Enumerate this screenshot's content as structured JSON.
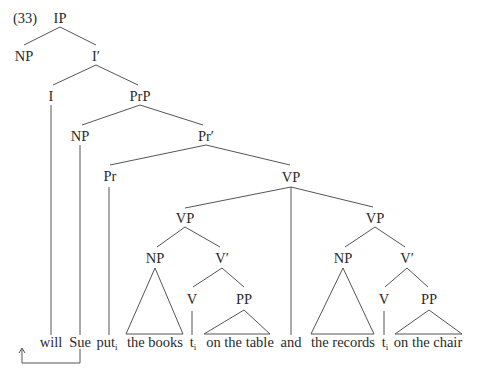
{
  "example_number": "(33)",
  "tree": {
    "nodes": [
      {
        "id": "IP",
        "label": "IP",
        "x": 60,
        "y": 18
      },
      {
        "id": "NP1",
        "label": "NP",
        "x": 29,
        "y": 56
      },
      {
        "id": "Ibar",
        "label": "I′",
        "x": 96,
        "y": 56
      },
      {
        "id": "I",
        "label": "I",
        "x": 51,
        "y": 96
      },
      {
        "id": "PrP",
        "label": "PrP",
        "x": 140,
        "y": 96
      },
      {
        "id": "NP2",
        "label": "NP",
        "x": 80,
        "y": 136
      },
      {
        "id": "Prbar",
        "label": "Pr′",
        "x": 206,
        "y": 136
      },
      {
        "id": "Pr",
        "label": "Pr",
        "x": 110,
        "y": 176
      },
      {
        "id": "VP0",
        "label": "VP",
        "x": 291,
        "y": 176
      },
      {
        "id": "VP1",
        "label": "VP",
        "x": 185,
        "y": 218
      },
      {
        "id": "VP2",
        "label": "VP",
        "x": 375,
        "y": 218
      },
      {
        "id": "NP3",
        "label": "NP",
        "x": 155,
        "y": 258
      },
      {
        "id": "Vbar1",
        "label": "V′",
        "x": 222,
        "y": 258
      },
      {
        "id": "NP4",
        "label": "NP",
        "x": 343,
        "y": 258
      },
      {
        "id": "Vbar2",
        "label": "V′",
        "x": 407,
        "y": 258
      },
      {
        "id": "V1",
        "label": "V",
        "x": 192,
        "y": 298
      },
      {
        "id": "PP1",
        "label": "PP",
        "x": 244,
        "y": 298
      },
      {
        "id": "V2",
        "label": "V",
        "x": 384,
        "y": 298
      },
      {
        "id": "PP2",
        "label": "PP",
        "x": 429,
        "y": 298
      }
    ],
    "leaves": [
      {
        "id": "will",
        "text": "will",
        "sub": "",
        "x": 51
      },
      {
        "id": "Sue",
        "text": "Sue",
        "sub": "",
        "x": 80
      },
      {
        "id": "put",
        "text": "put",
        "sub": "i",
        "x": 110
      },
      {
        "id": "thebooks",
        "text": "the books",
        "sub": "",
        "x": 155
      },
      {
        "id": "t1",
        "text": "t",
        "sub": "i",
        "x": 192
      },
      {
        "id": "onthetable",
        "text": "on the table",
        "sub": "",
        "x": 244
      },
      {
        "id": "and",
        "text": "and",
        "sub": "",
        "x": 291
      },
      {
        "id": "therecords",
        "text": "the records",
        "sub": "",
        "x": 343
      },
      {
        "id": "t2",
        "text": "t",
        "sub": "i",
        "x": 384
      },
      {
        "id": "onthechair",
        "text": "on the chair",
        "sub": "",
        "x": 429
      }
    ],
    "leaf_baseline_y": 347,
    "movement_arrow": {
      "from": "Sue",
      "to": "before-will",
      "description": "Sue raised to spec-IP"
    }
  }
}
